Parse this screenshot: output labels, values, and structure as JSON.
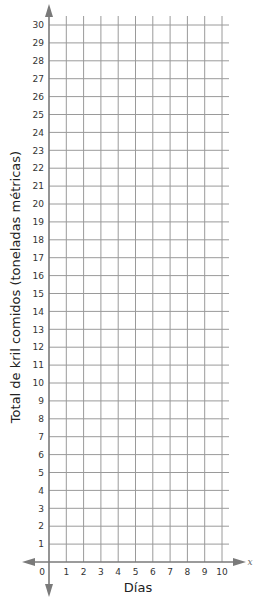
{
  "chart_data": {
    "type": "scatter",
    "title": "",
    "xlabel": "Días",
    "ylabel": "Total de kril comidos (toneladas métricas)",
    "x_axis_variable": "x",
    "xlim": [
      0,
      10
    ],
    "ylim": [
      0,
      30
    ],
    "x_ticks": [
      0,
      1,
      2,
      3,
      4,
      5,
      6,
      7,
      8,
      9,
      10
    ],
    "y_ticks": [
      1,
      2,
      3,
      4,
      5,
      6,
      7,
      8,
      9,
      10,
      11,
      12,
      13,
      14,
      15,
      16,
      17,
      18,
      19,
      20,
      21,
      22,
      23,
      24,
      25,
      26,
      27,
      28,
      29,
      30
    ],
    "origin_label": "0",
    "grid": true,
    "series": [],
    "legend": null
  },
  "colors": {
    "grid": "#9a9a9a",
    "axis": "#7a7a7a",
    "text": "#333333"
  }
}
